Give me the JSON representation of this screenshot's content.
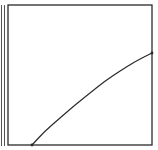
{
  "diagram": {
    "type": "curve-in-box",
    "colors": {
      "background": "#ffffff",
      "stroke": "#2a2a2a",
      "margin_lines": "#555555"
    },
    "frame": {
      "left": 8,
      "top": 5,
      "right": 152,
      "bottom": 145
    },
    "margin_lines_x": [
      1.5,
      4.5
    ],
    "curve": {
      "points": [
        [
          32,
          145
        ],
        [
          45,
          131
        ],
        [
          60,
          118
        ],
        [
          75,
          105
        ],
        [
          90,
          93
        ],
        [
          105,
          81
        ],
        [
          120,
          71
        ],
        [
          136,
          61
        ],
        [
          152,
          53
        ]
      ],
      "start_marker": [
        32,
        145
      ],
      "end_marker": [
        152,
        53
      ]
    }
  },
  "chart_data": {
    "type": "line",
    "title": "",
    "xlabel": "",
    "ylabel": "",
    "grid": false,
    "legend": null,
    "series": [
      {
        "name": "curve",
        "x": [
          0.17,
          0.26,
          0.36,
          0.47,
          0.57,
          0.67,
          0.78,
          0.89,
          1.0
        ],
        "y": [
          0.0,
          0.1,
          0.19,
          0.29,
          0.37,
          0.46,
          0.53,
          0.6,
          0.66
        ]
      }
    ],
    "xlim": [
      0,
      1
    ],
    "ylim": [
      0,
      1
    ]
  }
}
